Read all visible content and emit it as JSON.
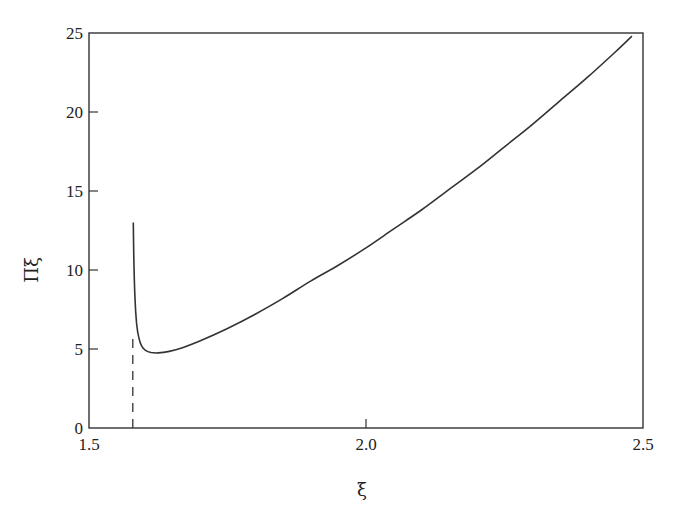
{
  "chart_data": {
    "type": "line",
    "title": "",
    "xlabel": "ξ",
    "ylabel": "Πξ",
    "xlim": [
      1.5,
      2.5
    ],
    "ylim": [
      0,
      25
    ],
    "grid": false,
    "legend": null,
    "x_ticks": [
      {
        "value": 1.5,
        "label": "1.5"
      },
      {
        "value": 2.0,
        "label": "2.0"
      },
      {
        "value": 2.5,
        "label": "2.5"
      }
    ],
    "y_ticks": [
      {
        "value": 0,
        "label": "0"
      },
      {
        "value": 5,
        "label": "5"
      },
      {
        "value": 10,
        "label": "10"
      },
      {
        "value": 15,
        "label": "15"
      },
      {
        "value": 20,
        "label": "20"
      },
      {
        "value": 25,
        "label": "25"
      }
    ],
    "series": [
      {
        "name": "Πξ",
        "style": "solid",
        "x": [
          1.58,
          1.581,
          1.583,
          1.586,
          1.59,
          1.595,
          1.602,
          1.612,
          1.625,
          1.645,
          1.67,
          1.7,
          1.75,
          1.8,
          1.85,
          1.9,
          1.95,
          2.0,
          2.05,
          2.1,
          2.15,
          2.2,
          2.25,
          2.3,
          2.35,
          2.4,
          2.45,
          2.48
        ],
        "values": [
          13.0,
          10.5,
          8.2,
          6.6,
          5.7,
          5.2,
          4.92,
          4.78,
          4.75,
          4.85,
          5.1,
          5.5,
          6.3,
          7.2,
          8.2,
          9.3,
          10.3,
          11.4,
          12.6,
          13.8,
          15.1,
          16.4,
          17.8,
          19.2,
          20.7,
          22.2,
          23.8,
          24.8
        ]
      },
      {
        "name": "asymptote",
        "style": "dashed",
        "x": [
          1.579,
          1.579
        ],
        "values": [
          0,
          5.9
        ]
      }
    ]
  },
  "axes": {
    "xlabel": "ξ",
    "ylabel": "Πξ"
  }
}
